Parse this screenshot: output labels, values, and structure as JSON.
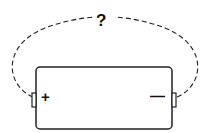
{
  "diagram": {
    "question_mark": "?",
    "battery": {
      "positive_label": "+",
      "negative_label": "—"
    },
    "colors": {
      "stroke": "#222222",
      "background": "#ffffff"
    }
  }
}
